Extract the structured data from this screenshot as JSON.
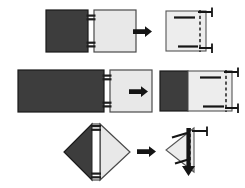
{
  "diagram": {
    "background_color": "#ffffff",
    "colors": {
      "dark_panel": "#3d3d3d",
      "light_panel": "#e8e8e8",
      "outline": "#1a1a1a",
      "fold_line": "#2b2b2b",
      "bracket": "#151515",
      "arrow": "#141414"
    },
    "rows": [
      {
        "id": "row-1",
        "name": "square-to-square-fold",
        "before": {
          "left_panel": {
            "shape": "square",
            "fill": "dark",
            "width": 42,
            "height": 42
          },
          "right_panel": {
            "shape": "square",
            "fill": "light",
            "width": 42,
            "height": 42
          },
          "hinge_marks": 2
        },
        "operator": "arrow-right",
        "after": {
          "panel": {
            "shape": "square",
            "fill": "light",
            "width": 40,
            "height": 40
          },
          "fold_line": "vertical-dashed-right",
          "brackets": 2,
          "ticks": 2
        }
      },
      {
        "id": "row-2",
        "name": "wide-panel-to-square-fold",
        "before": {
          "left_panel": {
            "shape": "rectangle",
            "fill": "dark",
            "width": 86,
            "height": 42
          },
          "right_panel": {
            "shape": "square",
            "fill": "light",
            "width": 42,
            "height": 42
          },
          "hinge_marks": 2
        },
        "operator": "arrow-right",
        "after": {
          "panel": {
            "shape": "rectangle-split",
            "fill": "dark-and-light",
            "width": 72,
            "height": 42
          },
          "fold_line": "vertical-dashed-right",
          "brackets": 2,
          "ticks": 2
        }
      },
      {
        "id": "row-3",
        "name": "diamond-triangle-fold",
        "before": {
          "left_panel": {
            "shape": "triangle",
            "fill": "dark"
          },
          "right_panel": {
            "shape": "triangle",
            "fill": "light"
          },
          "hinge_marks": 2
        },
        "operator": "arrow-right",
        "after": {
          "panel": {
            "shape": "triangle",
            "fill": "light"
          },
          "fold_line": "vertical-dashed-right",
          "brackets": 1,
          "ticks": 1,
          "fold_arrow": "arrow-down"
        }
      }
    ]
  }
}
